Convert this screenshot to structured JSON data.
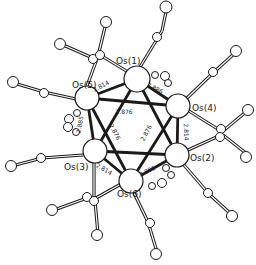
{
  "figure": {
    "type": "ortep-molecular-structure",
    "colors": {
      "ink": "#1a1a1a",
      "background": "#ffffff"
    },
    "metal_atoms": [
      {
        "id": "Os1",
        "label": "Os(1)",
        "x": 137,
        "y": 79,
        "r": 13,
        "label_x": 116,
        "label_y": 64
      },
      {
        "id": "Os5",
        "label": "Os(5)",
        "x": 87,
        "y": 98,
        "r": 12,
        "label_x": 72,
        "label_y": 88
      },
      {
        "id": "Os4",
        "label": "Os(4)",
        "x": 178,
        "y": 106,
        "r": 12,
        "label_x": 192,
        "label_y": 111
      },
      {
        "id": "Os3",
        "label": "Os(3)",
        "x": 95,
        "y": 151,
        "r": 12,
        "label_x": 64,
        "label_y": 170
      },
      {
        "id": "Os2",
        "label": "Os(2)",
        "x": 177,
        "y": 155,
        "r": 12,
        "label_x": 190,
        "label_y": 161
      },
      {
        "id": "Os6",
        "label": "Os(6)",
        "x": 131,
        "y": 181,
        "r": 12,
        "label_x": 117,
        "label_y": 197
      }
    ],
    "bond_labels": [
      {
        "text": "2.814",
        "x": 102,
        "y": 88,
        "rot": -28
      },
      {
        "text": "2.886",
        "x": 154,
        "y": 90,
        "rot": 28
      },
      {
        "text": "2.876",
        "x": 124,
        "y": 114,
        "rot": 0
      },
      {
        "text": "2.885",
        "x": 82,
        "y": 125,
        "rot": -80
      },
      {
        "text": "2.814",
        "x": 184,
        "y": 132,
        "rot": 88
      },
      {
        "text": "2.876",
        "x": 113,
        "y": 133,
        "rot": 62
      },
      {
        "text": "2.876",
        "x": 148,
        "y": 134,
        "rot": -62
      },
      {
        "text": "2.814",
        "x": 103,
        "y": 171,
        "rot": 30
      },
      {
        "text": "2.886",
        "x": 148,
        "y": 173,
        "rot": -25
      }
    ]
  }
}
